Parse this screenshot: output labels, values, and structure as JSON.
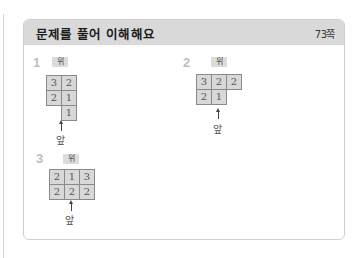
{
  "card": {
    "title": "문제를 풀어 이해해요",
    "page_ref": "73쪽"
  },
  "problems": [
    {
      "number": "1",
      "top_label": "위",
      "front_label": "앞",
      "cells": [
        {
          "row": 0,
          "col": 0,
          "value": "3"
        },
        {
          "row": 0,
          "col": 1,
          "value": "2"
        },
        {
          "row": 1,
          "col": 0,
          "value": "2"
        },
        {
          "row": 1,
          "col": 1,
          "value": "1"
        },
        {
          "row": 2,
          "col": 1,
          "value": "1"
        }
      ]
    },
    {
      "number": "2",
      "top_label": "위",
      "front_label": "앞",
      "cells": [
        {
          "row": 0,
          "col": 0,
          "value": "3"
        },
        {
          "row": 0,
          "col": 1,
          "value": "2"
        },
        {
          "row": 0,
          "col": 2,
          "value": "2"
        },
        {
          "row": 1,
          "col": 0,
          "value": "2"
        },
        {
          "row": 1,
          "col": 1,
          "value": "1"
        }
      ]
    },
    {
      "number": "3",
      "top_label": "위",
      "front_label": "앞",
      "cells": [
        {
          "row": 0,
          "col": 0,
          "value": "2"
        },
        {
          "row": 0,
          "col": 1,
          "value": "1"
        },
        {
          "row": 0,
          "col": 2,
          "value": "3"
        },
        {
          "row": 1,
          "col": 0,
          "value": "2"
        },
        {
          "row": 1,
          "col": 1,
          "value": "2"
        },
        {
          "row": 1,
          "col": 2,
          "value": "2"
        }
      ]
    }
  ]
}
